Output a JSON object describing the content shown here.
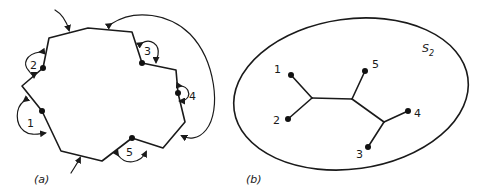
{
  "panel_a": {
    "caption": "(a)",
    "vertex_labels": [
      "1",
      "2",
      "3",
      "4",
      "5"
    ],
    "description": "Polygon with 5 marked boundary points and curved arrows indicating identifications/rotations"
  },
  "panel_b": {
    "caption": "(b)",
    "surface_label": "S",
    "surface_subscript": "2",
    "leaf_labels": [
      "1",
      "2",
      "3",
      "4",
      "5"
    ],
    "description": "Tree with 5 leaves embedded in sphere S2"
  },
  "colors": {
    "ink": "#1a1a1a",
    "background": "#ffffff"
  }
}
